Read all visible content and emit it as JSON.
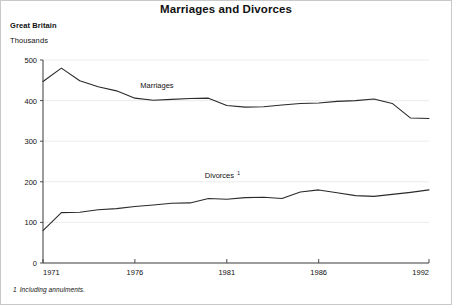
{
  "figure": {
    "title": "Marriages and Divorces",
    "region": "Great Britain",
    "units": "Thousands",
    "footnote_marker": "1",
    "footnote_text": "Including annulments."
  },
  "chart_data": {
    "type": "line",
    "title": "Marriages and Divorces",
    "subtitle": "Great Britain",
    "xlabel": "",
    "ylabel": "Thousands",
    "xlim": [
      1971,
      1992
    ],
    "ylim": [
      0,
      500
    ],
    "yticks": [
      0,
      100,
      200,
      300,
      400,
      500
    ],
    "ytick_labels": [
      "0",
      "100",
      "200",
      "300",
      "400",
      "500"
    ],
    "xticks": [
      1971,
      1976,
      1981,
      1986,
      1992
    ],
    "xtick_labels": [
      "1971",
      "1976",
      "1981",
      "1986",
      "1992"
    ],
    "grid": "horizontal-faint",
    "legend": "inline-labels",
    "annotations": [
      {
        "text": "Marriages",
        "x": 1977.2,
        "y": 432
      },
      {
        "text": "Divorces",
        "superscript": "1",
        "x": 1980.6,
        "y": 210
      }
    ],
    "x": [
      1971,
      1972,
      1973,
      1974,
      1975,
      1976,
      1977,
      1978,
      1979,
      1980,
      1981,
      1982,
      1983,
      1984,
      1985,
      1986,
      1987,
      1988,
      1989,
      1990,
      1991,
      1992
    ],
    "series": [
      {
        "name": "Marriages",
        "values": [
          447,
          480,
          449,
          434,
          424,
          406,
          401,
          403,
          405,
          406,
          388,
          384,
          385,
          389,
          393,
          394,
          398,
          400,
          404,
          393,
          357,
          356
        ]
      },
      {
        "name": "Divorces",
        "values": [
          80,
          124,
          125,
          131,
          134,
          139,
          143,
          147,
          148,
          159,
          157,
          161,
          162,
          159,
          175,
          180,
          173,
          166,
          164,
          169,
          174,
          180
        ]
      }
    ]
  }
}
